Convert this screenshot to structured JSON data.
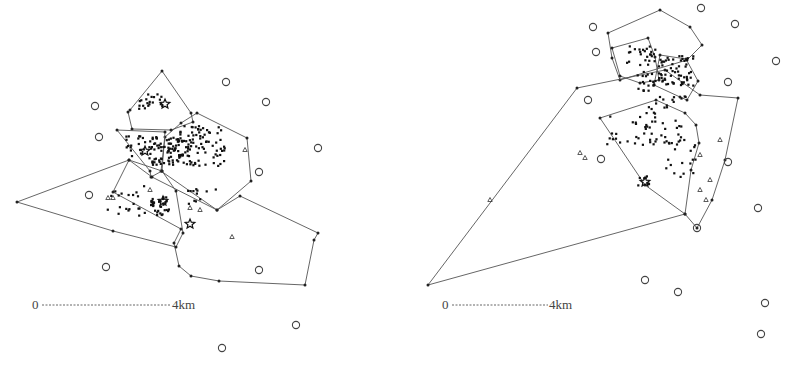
{
  "figure": {
    "panels": [
      {
        "id": "left",
        "scale_bar": {
          "start_label": "0",
          "end_label": "4km"
        },
        "polygons": [
          [
            [
              162,
              71
            ],
            [
              191,
              113
            ],
            [
              193,
              122
            ],
            [
              171,
              130
            ],
            [
              132,
              129
            ],
            [
              128,
              112
            ],
            [
              130,
              110
            ]
          ],
          [
            [
              197,
              113
            ],
            [
              247,
              138
            ],
            [
              251,
              181
            ],
            [
              217,
              210
            ],
            [
              161,
              171
            ],
            [
              165,
              137
            ],
            [
              181,
              123
            ]
          ],
          [
            [
              117,
              130
            ],
            [
              165,
              132
            ],
            [
              162,
              171
            ],
            [
              151,
              177
            ],
            [
              150,
              171
            ]
          ],
          [
            [
              129,
              160
            ],
            [
              152,
              177
            ],
            [
              217,
              210
            ],
            [
              240,
              196
            ],
            [
              318,
              233
            ],
            [
              314,
              240
            ],
            [
              305,
              285
            ],
            [
              219,
              281
            ],
            [
              191,
              276
            ],
            [
              179,
              266
            ],
            [
              174,
              243
            ],
            [
              181,
              229
            ],
            [
              113,
              192
            ]
          ],
          [
            [
              17,
              202
            ],
            [
              129,
              160
            ],
            [
              162,
              171
            ],
            [
              176,
              191
            ],
            [
              183,
              233
            ],
            [
              176,
              247
            ],
            [
              113,
              231
            ]
          ]
        ],
        "stations": [
          [
            226,
            82
          ],
          [
            95,
            106
          ],
          [
            266,
            102
          ],
          [
            99,
            137
          ],
          [
            318,
            148
          ],
          [
            259,
            172
          ],
          [
            89,
            195
          ],
          [
            106,
            267
          ],
          [
            259,
            270
          ],
          [
            296,
            325
          ],
          [
            222,
            348
          ]
        ],
        "star_events": [
          [
            165,
            104
          ],
          [
            145,
            151
          ],
          [
            163,
            201
          ],
          [
            190,
            224
          ]
        ]
      },
      {
        "id": "right",
        "scale_bar": {
          "start_label": "0",
          "end_label": "4km"
        },
        "polygons": [
          [
            [
              660,
              10
            ],
            [
              690,
              27
            ],
            [
              702,
              45
            ],
            [
              687,
              60
            ],
            [
              620,
              80
            ],
            [
              612,
              58
            ],
            [
              608,
              33
            ]
          ],
          [
            [
              612,
              48
            ],
            [
              648,
              38
            ],
            [
              655,
              57
            ],
            [
              659,
              80
            ],
            [
              640,
              83
            ],
            [
              620,
              76
            ]
          ],
          [
            [
              660,
              55
            ],
            [
              686,
              59
            ],
            [
              698,
              81
            ],
            [
              687,
              100
            ],
            [
              680,
              97
            ],
            [
              654,
              85
            ]
          ],
          [
            [
              428,
              285
            ],
            [
              577,
              88
            ],
            [
              665,
              70
            ],
            [
              700,
              95
            ],
            [
              738,
              98
            ],
            [
              725,
              160
            ],
            [
              712,
              200
            ],
            [
              697,
              228
            ],
            [
              685,
              214
            ]
          ],
          [
            [
              600,
              118
            ],
            [
              656,
              100
            ],
            [
              685,
              113
            ],
            [
              696,
              125
            ],
            [
              699,
              143
            ],
            [
              691,
              170
            ],
            [
              685,
              214
            ],
            [
              645,
              185
            ]
          ]
        ],
        "stations": [
          [
            701,
            8
          ],
          [
            735,
            24
          ],
          [
            593,
            27
          ],
          [
            596,
            52
          ],
          [
            776,
            61
          ],
          [
            728,
            82
          ],
          [
            588,
            100
          ],
          [
            601,
            159
          ],
          [
            728,
            162
          ],
          [
            758,
            208
          ],
          [
            697,
            228
          ],
          [
            645,
            280
          ],
          [
            678,
            292
          ],
          [
            765,
            303
          ],
          [
            761,
            334
          ]
        ],
        "star_events": [
          [
            645,
            182
          ]
        ]
      }
    ]
  }
}
